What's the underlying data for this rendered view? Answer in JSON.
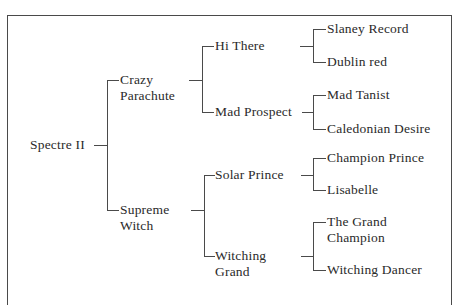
{
  "diagram": {
    "type": "pedigree-chart",
    "root": {
      "name": "Spectre II",
      "sire": {
        "name_lines": [
          "Crazy",
          "Parachute"
        ],
        "name": "Crazy Parachute",
        "sire": {
          "name": "Hi There",
          "sire": {
            "name": "Slaney Record"
          },
          "dam": {
            "name": "Dublin red"
          }
        },
        "dam": {
          "name": "Mad Prospect",
          "sire": {
            "name": "Mad Tanist"
          },
          "dam": {
            "name": "Caledonian Desire"
          }
        }
      },
      "dam": {
        "name_lines": [
          "Supreme",
          "Witch"
        ],
        "name": "Supreme Witch",
        "sire": {
          "name": "Solar Prince",
          "sire": {
            "name": "Champion Prince"
          },
          "dam": {
            "name": "Lisabelle"
          }
        },
        "dam": {
          "name_lines": [
            "Witching",
            "Grand"
          ],
          "name": "Witching Grand",
          "sire": {
            "name_lines": [
              "The Grand",
              "Champion"
            ],
            "name": "The Grand Champion"
          },
          "dam": {
            "name": "Witching Dancer"
          }
        }
      }
    }
  },
  "colors": {
    "line": "#4a4a4a",
    "text": "#2a2a2a",
    "background": "#ffffff"
  }
}
